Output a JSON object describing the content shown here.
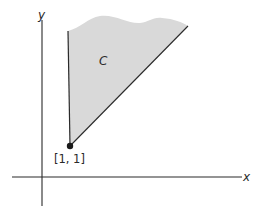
{
  "figure": {
    "axes": {
      "x_label": "x",
      "y_label": "y"
    },
    "region": {
      "label": "C",
      "fill": "#d9d9d9"
    },
    "point": {
      "label": "[1, 1]"
    },
    "colors": {
      "ink": "#2a2a2a",
      "shade": "#d9d9d9"
    }
  }
}
